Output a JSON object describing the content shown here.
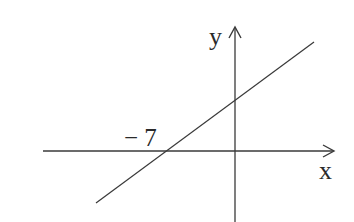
{
  "diagram": {
    "type": "linear-function-graph",
    "axes": {
      "x_label": "x",
      "y_label": "y"
    },
    "annotations": {
      "x_intercept_label": "− 7"
    },
    "line": {
      "description": "straight line with positive slope crossing x-axis at -7 and positive y-axis",
      "x_intercept": -7
    },
    "colors": {
      "stroke": "#3a3a3a",
      "background": "#ffffff"
    }
  }
}
